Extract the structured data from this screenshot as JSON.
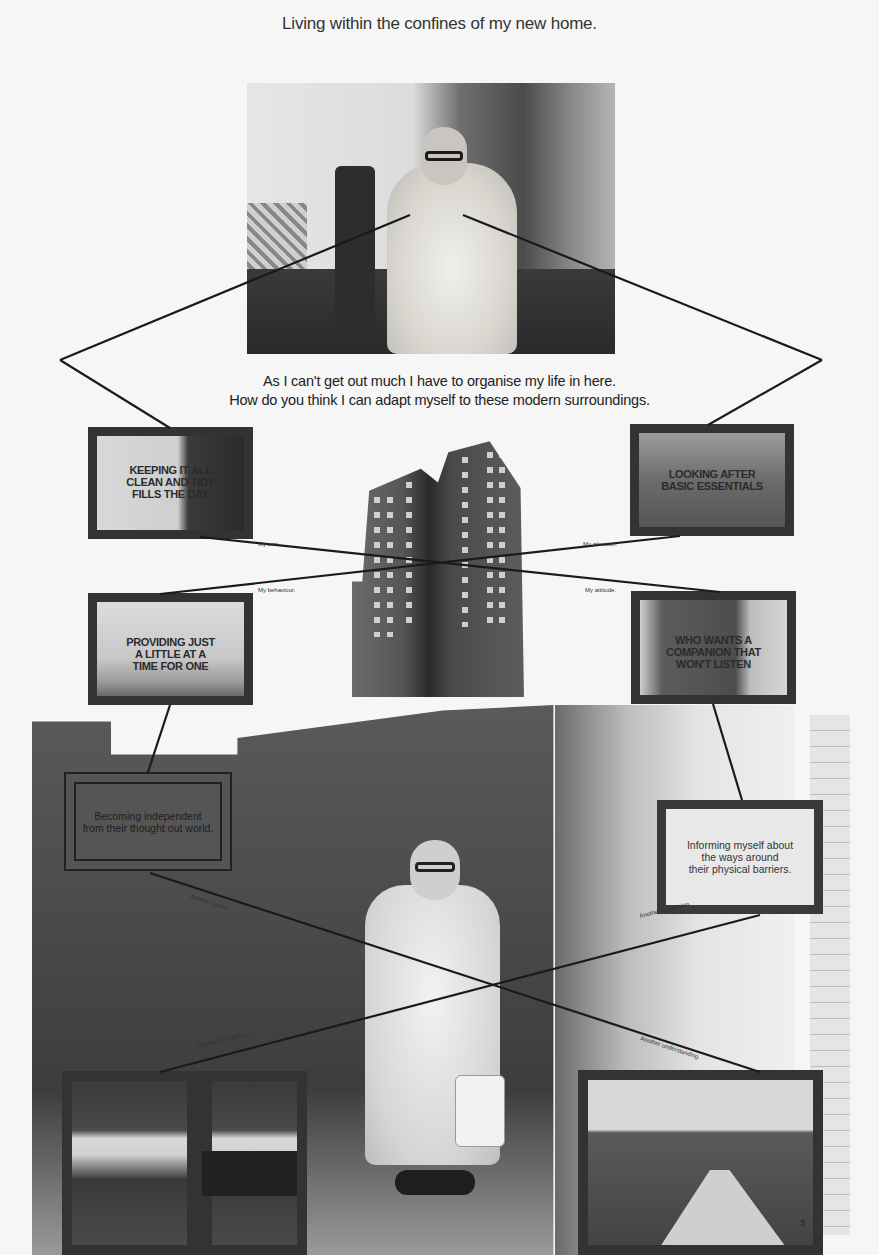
{
  "header": {
    "title": "Living within the confines of my new home."
  },
  "subtitle": {
    "line1": "As I can't get out much I have to organise my life in here.",
    "line2": "How do you think I can adapt myself to these modern surroundings."
  },
  "tv_panels": [
    {
      "caption": "KEEPING IT ALL CLEAN AND TIDY FILLS THE DAY",
      "lines": [
        "KEEPING IT ALL",
        "CLEAN AND TIDY",
        "FILLS THE DAY"
      ]
    },
    {
      "caption": "LOOKING AFTER BASIC ESSENTIALS",
      "lines": [
        "LOOKING AFTER",
        "BASIC ESSENTIALS"
      ]
    },
    {
      "caption": "PROVIDING JUST A LITTLE AT A TIME FOR ONE",
      "lines": [
        "PROVIDING JUST",
        "A LITTLE AT A",
        "TIME FOR ONE"
      ]
    },
    {
      "caption": "WHO WANTS A COMPANION THAT WON'T LISTEN",
      "lines": [
        "WHO WANTS A",
        "COMPANION THAT",
        "WON'T LISTEN"
      ]
    }
  ],
  "line_labels": {
    "top_left": "My cats.",
    "top_right": "My attention.",
    "mid_left": "My behaviour.",
    "mid_right": "My attitude.",
    "lower_left_1": "Another reality.",
    "lower_right_1": "Another conclusion.",
    "bottom_left": "Another perception.",
    "bottom_right": "Another understanding."
  },
  "text_boxes": {
    "left": {
      "lines": [
        "Becoming independent",
        "from their thought out world."
      ]
    },
    "right": {
      "lines": [
        "Informing myself about",
        "the ways around",
        "their physical barriers."
      ]
    }
  },
  "page_number": "3",
  "colors": {
    "paper": "#f6f6f6",
    "frame": "#333333",
    "text": "#2a2a2a"
  }
}
